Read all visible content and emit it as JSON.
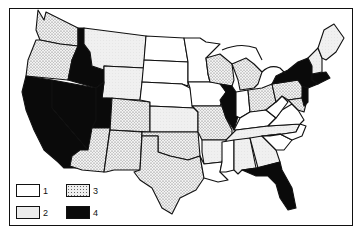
{
  "map": {
    "title": "",
    "type": "choropleth",
    "region": "Contiguous United States",
    "colors": {
      "1": "#ffffff",
      "2": "#ececec",
      "3": "dotted",
      "4": "#0a0a0a"
    },
    "categories": {
      "4": [
        "California",
        "Nevada",
        "Idaho",
        "Utah",
        "Illinois",
        "New York",
        "New Jersey",
        "Connecticut",
        "Rhode Island",
        "Massachusetts",
        "Florida"
      ],
      "3": [
        "Washington",
        "Oregon",
        "Colorado",
        "Arizona",
        "New Mexico",
        "Texas",
        "Oklahoma",
        "Wisconsin",
        "Michigan",
        "Missouri",
        "Ohio",
        "Pennsylvania",
        "Delaware",
        "Maryland"
      ],
      "2": [
        "Montana",
        "Wyoming",
        "Kansas",
        "Arkansas",
        "Tennessee",
        "Alabama",
        "Georgia",
        "Maine",
        "Vermont",
        "New Hampshire"
      ],
      "1": [
        "North Dakota",
        "South Dakota",
        "Nebraska",
        "Minnesota",
        "Iowa",
        "Indiana",
        "Kentucky",
        "West Virginia",
        "Virginia",
        "North Carolina",
        "South Carolina",
        "Mississippi",
        "Louisiana"
      ]
    }
  },
  "legend": {
    "items": [
      {
        "label": "1",
        "fill": "white"
      },
      {
        "label": "2",
        "fill": "light"
      },
      {
        "label": "3",
        "fill": "dotted"
      },
      {
        "label": "4",
        "fill": "black"
      }
    ]
  }
}
